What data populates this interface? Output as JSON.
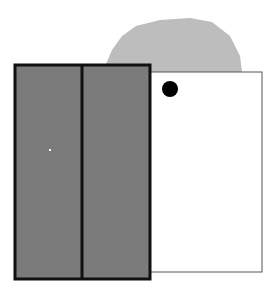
{
  "scene": {
    "background": "#ffffff",
    "blob": {
      "fill": "#bdbdbd",
      "points": "106,64 112,50 122,36 136,26 160,20 190,18 212,22 230,36 240,56 243,80 242,100 236,124 228,144 214,158 196,170 180,176 160,177 150,176 150,64"
    },
    "white_rect": {
      "x": 150,
      "y": 72,
      "w": 112,
      "h": 200,
      "fill": "#ffffff",
      "stroke": "#555555"
    },
    "dark_rect": {
      "x": 15,
      "y": 65,
      "w": 135,
      "h": 214,
      "fill": "#7b7b7b",
      "stroke": "#111111",
      "divider_x": 82
    },
    "dot": {
      "cx": 170,
      "cy": 89,
      "r": 8,
      "fill": "#000000"
    },
    "speck": {
      "x": 49,
      "y": 149,
      "fill": "#ffffff"
    }
  }
}
